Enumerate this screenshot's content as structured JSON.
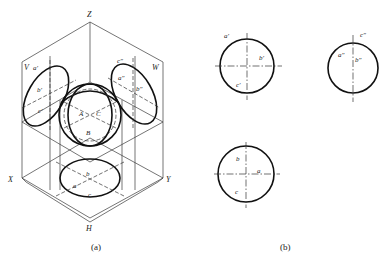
{
  "figure_a": {
    "caption": "(a)",
    "axes": {
      "z": "Z",
      "x": "X",
      "y": "Y",
      "h": "H"
    },
    "planes": {
      "v": "V",
      "w": "W"
    },
    "v_points": {
      "a": "a′",
      "b": "b′",
      "c": "c′"
    },
    "w_points": {
      "a": "a″",
      "b": "b″",
      "c": "c″"
    },
    "h_points": {
      "a": "a",
      "b": "b",
      "c": "c"
    },
    "sphere_points": {
      "a": "A",
      "b": "B",
      "c": "C"
    }
  },
  "figure_b": {
    "caption": "(b)",
    "front_view": {
      "a": "a′",
      "b": "b′",
      "c": "c′"
    },
    "side_view": {
      "a": "a″",
      "b": "b″",
      "c": "c″"
    },
    "top_view": {
      "a": "a",
      "b": "b",
      "c": "c"
    }
  },
  "colors": {
    "line": "#111111",
    "background": "#ffffff"
  }
}
